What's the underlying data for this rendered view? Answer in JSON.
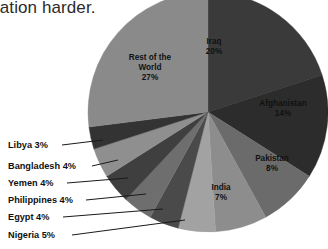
{
  "page": {
    "background_color": "#ffffff",
    "cropped_heading_text": "ration harder."
  },
  "chart_data": {
    "type": "pie",
    "title": "",
    "subtitle": "",
    "xlabel": "",
    "ylabel": "",
    "legend_position": "none",
    "grid": false,
    "units": "percent",
    "center": {
      "x": 208,
      "y": 112
    },
    "radius": 120,
    "start_angle_deg": 0,
    "direction": "clockwise",
    "categories": [
      "Iraq",
      "Afghanistan",
      "Pakistan",
      "India",
      "Nigeria",
      "Egypt",
      "Philippines",
      "Yemen",
      "Bangladesh",
      "Libya",
      "Rest of the World"
    ],
    "values": [
      20,
      14,
      8,
      7,
      5,
      4,
      4,
      4,
      4,
      3,
      27
    ],
    "slices": [
      {
        "name": "Iraq",
        "value": 20,
        "label": "Iraq",
        "value_label": "20%",
        "color": "#3a3a3a",
        "label_placement": "inside",
        "label_x": 214,
        "label_y": 44
      },
      {
        "name": "Afghanistan",
        "value": 14,
        "label": "Afghanistan",
        "value_label": "14%",
        "color": "#2c2c2c",
        "label_placement": "inside",
        "label_x": 283,
        "label_y": 106
      },
      {
        "name": "Pakistan",
        "value": 8,
        "label": "Pakistan",
        "value_label": "8%",
        "color": "#6b6b6b",
        "label_placement": "inside",
        "label_x": 272,
        "label_y": 161
      },
      {
        "name": "India",
        "value": 7,
        "label": "India",
        "value_label": "7%",
        "color": "#8d8d8d",
        "label_placement": "inside",
        "label_x": 221,
        "label_y": 190
      },
      {
        "name": "Nigeria",
        "value": 5,
        "label": "Nigeria 5%",
        "value_label": "5%",
        "color": "#a2a2a2",
        "label_placement": "callout",
        "label_x": 8,
        "label_y": 238,
        "leader_from_x": 72,
        "leader_from_y": 235,
        "leader_to_x": 185,
        "leader_to_y": 220
      },
      {
        "name": "Egypt",
        "value": 4,
        "label": "Egypt 4%",
        "value_label": "4%",
        "color": "#4a4a4a",
        "label_placement": "callout",
        "label_x": 8,
        "label_y": 220,
        "leader_from_x": 63,
        "leader_from_y": 217,
        "leader_to_x": 163,
        "leader_to_y": 209
      },
      {
        "name": "Philippines",
        "value": 4,
        "label": "Philippines 4%",
        "value_label": "4%",
        "color": "#6e6e6e",
        "label_placement": "callout",
        "label_x": 8,
        "label_y": 203,
        "leader_from_x": 86,
        "leader_from_y": 200,
        "leader_to_x": 146,
        "leader_to_y": 194
      },
      {
        "name": "Yemen",
        "value": 4,
        "label": "Yemen 4%",
        "value_label": "4%",
        "color": "#3f3f3f",
        "label_placement": "callout",
        "label_x": 8,
        "label_y": 186,
        "leader_from_x": 67,
        "leader_from_y": 183,
        "leader_to_x": 128,
        "leader_to_y": 178
      },
      {
        "name": "Bangladesh",
        "value": 4,
        "label": "Bangladesh 4%",
        "value_label": "4%",
        "color": "#8f8f8f",
        "label_placement": "callout",
        "label_x": 8,
        "label_y": 169,
        "leader_from_x": 92,
        "leader_from_y": 166,
        "leader_to_x": 118,
        "leader_to_y": 160
      },
      {
        "name": "Libya",
        "value": 3,
        "label": "Libya 3%",
        "value_label": "3%",
        "color": "#333333",
        "label_placement": "callout",
        "label_x": 8,
        "label_y": 148,
        "leader_from_x": 62,
        "leader_from_y": 145,
        "leader_to_x": 103,
        "leader_to_y": 140
      },
      {
        "name": "Rest of the World",
        "value": 27,
        "label": "Rest of the",
        "label_line2": "World",
        "value_label": "27%",
        "color": "#8a8a8a",
        "label_placement": "inside",
        "label_x": 150,
        "label_y": 60
      }
    ]
  }
}
